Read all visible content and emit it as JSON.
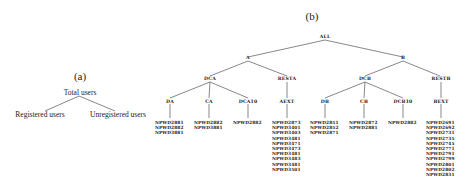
{
  "panel_a": {
    "caption": "(a)",
    "root": "Total users",
    "children": [
      "Registered users",
      "Unregistered users"
    ]
  },
  "panel_b": {
    "caption": "(b)",
    "root": "ALL",
    "level1": [
      "A",
      "B"
    ],
    "level2": [
      "DCA",
      "RESTA",
      "DCB",
      "RESTB"
    ],
    "level3": [
      "DA",
      "CA",
      "DCA10",
      "AEXT",
      "DB",
      "CB",
      "DCB10",
      "BEXT"
    ],
    "leaves": {
      "DA": [
        "NPWD2881",
        "NPWD2882",
        "NPWD3881"
      ],
      "CA": [
        "NPWD2882",
        "NPWD3881"
      ],
      "DCA10": [
        "NPWD2882"
      ],
      "AEXT": [
        "NPWD2873",
        "NPWD3401",
        "NPWD3403",
        "NPWD3481",
        "NPWD3471",
        "NPWD3473",
        "NPWD3481",
        "NPWD3483",
        "NPWD3481",
        "NPWD3501"
      ],
      "DB": [
        "NPWD2851",
        "NPWD2852",
        "NPWD2871"
      ],
      "CB": [
        "NPWD2872",
        "NPWD2881"
      ],
      "DCB10": [
        "NPWD2882"
      ],
      "BEXT": [
        "NPWD2691",
        "NPWD2692",
        "NPWD2731",
        "NPWD2735",
        "NPWD2745",
        "NPWD2771",
        "NPWD2791",
        "NPWD2799",
        "NPWD2801",
        "NPWD2802",
        "NPWD2831"
      ]
    }
  }
}
